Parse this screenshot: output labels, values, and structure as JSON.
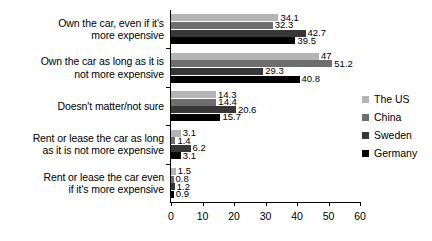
{
  "chart_data": {
    "type": "bar",
    "orientation": "horizontal",
    "title": "",
    "xlabel": "",
    "ylabel": "",
    "xlim": [
      0,
      60
    ],
    "xticks": [
      0,
      10,
      20,
      30,
      40,
      50,
      60
    ],
    "grid": false,
    "legend_position": "right",
    "categories": [
      "Own the car, even if it's more expensive",
      "Own the car as long as it is not more expensive",
      "Doesn't matter/not sure",
      "Rent or lease the car as long as it is not more expensive",
      "Rent or lease the car even if it's more expensive"
    ],
    "category_lines": [
      [
        "Own the car, even if it's",
        "more expensive"
      ],
      [
        "Own the car as long as it is",
        "not more expensive"
      ],
      [
        "Doesn't matter/not sure"
      ],
      [
        "Rent or lease the car as long",
        "as it is not more expensive"
      ],
      [
        "Rent or lease the car even",
        "if it's more expensive"
      ]
    ],
    "series": [
      {
        "name": "The US",
        "color": "#b4b4b4",
        "values": [
          34.1,
          47,
          14.3,
          3.1,
          1.5
        ],
        "labels": [
          "34.1",
          "47",
          "14.3",
          "3.1",
          "1.5"
        ]
      },
      {
        "name": "China",
        "color": "#6e6e6e",
        "values": [
          32.3,
          51.2,
          14.4,
          1.4,
          0.8
        ],
        "labels": [
          "32.3",
          "51.2",
          "14.4",
          "1.4",
          "0.8"
        ]
      },
      {
        "name": "Sweden",
        "color": "#373737",
        "values": [
          42.7,
          29.3,
          20.6,
          6.2,
          1.2
        ],
        "labels": [
          "42.7",
          "29.3",
          "20.6",
          "6.2",
          "1.2"
        ]
      },
      {
        "name": "Germany",
        "color": "#000000",
        "values": [
          39.5,
          40.8,
          15.7,
          3.1,
          0.9
        ],
        "labels": [
          "39.5",
          "40.8",
          "15.7",
          "3.1",
          "0.9"
        ]
      }
    ]
  }
}
